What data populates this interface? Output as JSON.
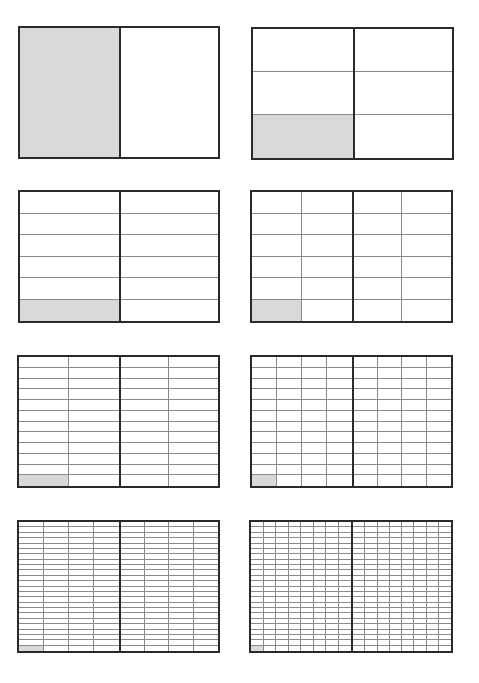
{
  "colors": {
    "border": "#2a2a2a",
    "gridline": "#8a8a8a",
    "shade": "#d9d9d9",
    "background": "#ffffff"
  },
  "panels": [
    {
      "id": "p1",
      "x": 18,
      "y": 26,
      "w": 202,
      "h": 133,
      "rows": 1,
      "cols_per_half": 1,
      "shaded": "bottom-left",
      "fraction": "1/2"
    },
    {
      "id": "p2",
      "x": 251,
      "y": 27,
      "w": 203,
      "h": 133,
      "rows": 3,
      "cols_per_half": 1,
      "shaded": "bottom-left",
      "fraction": "1/6"
    },
    {
      "id": "p3",
      "x": 18,
      "y": 190,
      "w": 202,
      "h": 133,
      "rows": 6,
      "cols_per_half": 1,
      "shaded": "bottom-left",
      "fraction": "1/12"
    },
    {
      "id": "p4",
      "x": 250,
      "y": 190,
      "w": 203,
      "h": 133,
      "rows": 6,
      "cols_per_half": 2,
      "shaded": "bottom-left",
      "fraction": "1/24"
    },
    {
      "id": "p5",
      "x": 17,
      "y": 355,
      "w": 203,
      "h": 133,
      "rows": 12,
      "cols_per_half": 2,
      "shaded": "bottom-left",
      "fraction": "1/48"
    },
    {
      "id": "p6",
      "x": 250,
      "y": 355,
      "w": 203,
      "h": 133,
      "rows": 12,
      "cols_per_half": 4,
      "shaded": "bottom-left",
      "fraction": "1/96"
    },
    {
      "id": "p7",
      "x": 17,
      "y": 520,
      "w": 203,
      "h": 133,
      "rows": 24,
      "cols_per_half": 4,
      "shaded": "bottom-left",
      "fraction": "1/192"
    },
    {
      "id": "p8",
      "x": 249,
      "y": 520,
      "w": 204,
      "h": 133,
      "rows": 24,
      "cols_per_half": 8,
      "shaded": "bottom-left",
      "fraction": "1/384"
    }
  ]
}
